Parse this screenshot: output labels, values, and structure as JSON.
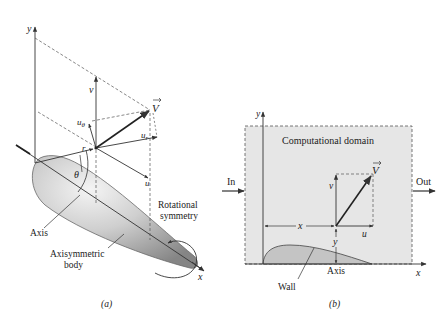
{
  "figure": {
    "panel_a": {
      "caption": "(a)",
      "axis_y": "y",
      "axis_x": "x",
      "vector_V": "V",
      "component_v": "v",
      "component_u": "u",
      "component_ur": "u",
      "component_ur_sub": "r",
      "component_utheta": "u",
      "component_utheta_sub": "θ",
      "radius": "r",
      "angle": "θ",
      "label_axis": "Axis",
      "label_body_1": "Axisymmetric",
      "label_body_2": "body",
      "label_rot_1": "Rotational",
      "label_rot_2": "symmetry"
    },
    "panel_b": {
      "caption": "(b)",
      "axis_y": "y",
      "axis_x": "x",
      "domain_label": "Computational domain",
      "inlet": "In",
      "outlet": "Out",
      "vector_V": "V",
      "component_v": "v",
      "component_u": "u",
      "dim_x": "x",
      "dim_y": "y",
      "label_axis": "Axis",
      "label_wall": "Wall"
    },
    "colors": {
      "line": "#333333",
      "domain_fill": "#e6e6e6",
      "wall_fill": "#c4c4c4",
      "body_light": "#e9e9e9",
      "body_dark": "#8a8a8a"
    }
  }
}
